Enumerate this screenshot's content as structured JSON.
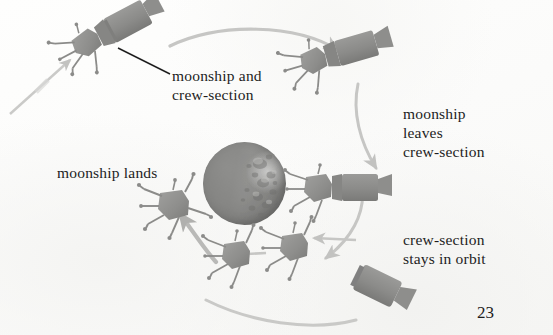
{
  "page": {
    "page_number": "23",
    "background_color": "#fdfdfc",
    "ink_color": "#1d1d1d"
  },
  "labels": {
    "moonship_and_crew_section": "moonship and\ncrew-section",
    "moonship_leaves_crew_section": "moonship\nleaves\ncrew-section",
    "moonship_lands": "moonship lands",
    "crew_section_stays_in_orbit": "crew-section\nstays in orbit"
  },
  "diagram": {
    "type": "illustrated-process-diagram",
    "moon": {
      "name": "moon",
      "center_x": 244,
      "center_y": 184,
      "diameter": 83,
      "body_color": "#8e8e8c",
      "lit_side": "right",
      "texture": "craters"
    },
    "spacecraft": [
      {
        "name": "moonship-and-crew-section-joined",
        "stage": 1,
        "x": 88,
        "y": 42,
        "rotation": -28,
        "parts": [
          "lander-with-legs",
          "cylindrical-crew-section"
        ],
        "color": "#8c8c8a"
      },
      {
        "name": "moonship-separating-from-crew-section",
        "stage": 2,
        "x": 310,
        "y": 52,
        "rotation": -18,
        "parts": [
          "lander-with-legs",
          "cylindrical-crew-section"
        ],
        "color": "#8c8c8a"
      },
      {
        "name": "moonship-beside-crew-section",
        "stage": 3,
        "x": 310,
        "y": 166,
        "rotation": 0,
        "parts": [
          "lander-with-legs",
          "cylindrical-crew-section"
        ],
        "color": "#8c8c8a"
      },
      {
        "name": "crew-section-in-orbit-alone",
        "stage": 4,
        "x": 358,
        "y": 272,
        "rotation": 28,
        "parts": [
          "cylindrical-crew-section"
        ],
        "color": "#8c8c8a"
      },
      {
        "name": "moonship-descending",
        "stage": 5,
        "x": 272,
        "y": 228,
        "rotation": 0,
        "parts": [
          "lander-with-legs"
        ],
        "color": "#8c8c8a"
      },
      {
        "name": "moonship-descending-lower",
        "stage": 6,
        "x": 210,
        "y": 244,
        "rotation": 0,
        "parts": [
          "lander-with-legs"
        ],
        "color": "#8c8c8a"
      },
      {
        "name": "moonship-landed",
        "stage": 7,
        "x": 152,
        "y": 194,
        "rotation": 0,
        "parts": [
          "lander-with-legs"
        ],
        "color": "#8c8c8a"
      }
    ],
    "arrows": [
      {
        "name": "arrow-incoming-trajectory",
        "from": [
          12,
          110
        ],
        "to": [
          72,
          58
        ],
        "style": "straight",
        "color": "#c9c9c7"
      },
      {
        "name": "arrow-orbit-top",
        "from": [
          172,
          44
        ],
        "to": [
          340,
          48
        ],
        "style": "curved",
        "color": "#c5c5c3"
      },
      {
        "name": "arrow-orbit-right-upper",
        "from": [
          362,
          86
        ],
        "to": [
          382,
          170
        ],
        "style": "curved",
        "color": "#c5c5c3"
      },
      {
        "name": "arrow-orbit-right-lower",
        "from": [
          360,
          186
        ],
        "to": [
          326,
          258
        ],
        "style": "curved",
        "color": "#c5c5c3"
      },
      {
        "name": "arrow-orbit-bottom",
        "from": [
          352,
          318
        ],
        "to": [
          206,
          300
        ],
        "style": "curved",
        "color": "#c5c5c3"
      },
      {
        "name": "arrow-crew-section-to-moonship",
        "from": [
          355,
          240
        ],
        "to": [
          312,
          238
        ],
        "style": "straight",
        "color": "#c5c5c3"
      },
      {
        "name": "arrow-descend-step",
        "from": [
          265,
          252
        ],
        "to": [
          226,
          254
        ],
        "style": "straight",
        "color": "#c5c5c3"
      },
      {
        "name": "arrow-descend-to-surface",
        "from": [
          215,
          260
        ],
        "to": [
          178,
          212
        ],
        "style": "curved",
        "color": "#b8b8b6"
      }
    ],
    "leader_lines": [
      {
        "name": "leader-line-moonship-crew-label",
        "from": [
          168,
          74
        ],
        "to": [
          120,
          50
        ],
        "color": "#1d1d1d"
      }
    ]
  }
}
